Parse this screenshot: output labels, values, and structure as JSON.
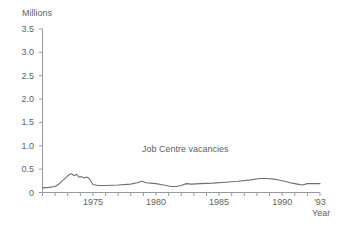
{
  "chart_data": {
    "type": "line",
    "title": "",
    "subtitle": "",
    "unit_label": "Millions",
    "xlabel": "Year",
    "ylabel": "",
    "ylim": [
      0,
      3.5
    ],
    "xlim": [
      1971,
      1993
    ],
    "grid": false,
    "legend_position": "inline-annotation",
    "y_ticks": [
      "3.5",
      "3.0",
      "2.5",
      "2.0",
      "1.5",
      "1.0",
      "0.5",
      "0"
    ],
    "y_tick_values": [
      3.5,
      3.0,
      2.5,
      2.0,
      1.5,
      1.0,
      0.5,
      0
    ],
    "x_ticks": [
      "1975",
      "1980",
      "1985",
      "1990",
      "'93"
    ],
    "x_tick_values": [
      1975,
      1980,
      1985,
      1990,
      1993
    ],
    "x_minor_tick_values": [
      1971,
      1972,
      1973,
      1974,
      1975,
      1976,
      1977,
      1978,
      1979,
      1980,
      1981,
      1982,
      1983,
      1984,
      1985,
      1986,
      1987,
      1988,
      1989,
      1990,
      1991,
      1992,
      1993
    ],
    "series": [
      {
        "name": "Job Centre vacancies",
        "color": "#6f6f6f",
        "x": [
          1971.0,
          1971.5,
          1972.0,
          1972.3,
          1972.6,
          1972.9,
          1973.1,
          1973.3,
          1973.5,
          1973.7,
          1973.9,
          1974.1,
          1974.3,
          1974.5,
          1974.7,
          1975.0,
          1975.4,
          1976.0,
          1977.0,
          1978.0,
          1978.5,
          1978.9,
          1979.2,
          1979.6,
          1980.0,
          1980.6,
          1981.2,
          1981.6,
          1982.0,
          1982.4,
          1982.8,
          1983.5,
          1984.5,
          1985.5,
          1986.5,
          1987.5,
          1988.2,
          1988.8,
          1989.5,
          1990.2,
          1990.8,
          1991.2,
          1991.6,
          1992.0,
          1992.5,
          1993.0
        ],
        "y": [
          0.1,
          0.11,
          0.13,
          0.18,
          0.26,
          0.33,
          0.38,
          0.4,
          0.36,
          0.39,
          0.33,
          0.34,
          0.31,
          0.33,
          0.3,
          0.17,
          0.15,
          0.15,
          0.16,
          0.18,
          0.21,
          0.24,
          0.21,
          0.2,
          0.19,
          0.16,
          0.13,
          0.13,
          0.15,
          0.19,
          0.18,
          0.19,
          0.2,
          0.22,
          0.24,
          0.27,
          0.3,
          0.3,
          0.28,
          0.24,
          0.2,
          0.18,
          0.16,
          0.19,
          0.19,
          0.19
        ]
      }
    ]
  },
  "colors": {
    "axis": "#9a9a9a",
    "text": "#5f5f5f",
    "line": "#6f6f6f",
    "background": "#ffffff"
  }
}
